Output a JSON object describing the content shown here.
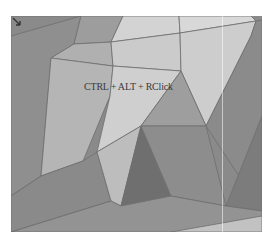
{
  "viewport": {
    "hint_text": "CTRL + ALT + RClick",
    "cursor_icon": "arrow-cursor-icon",
    "colors": {
      "edge": "#6e6e6e",
      "darkest": "#6f6f6f",
      "dark": "#858585",
      "mid": "#9c9c9c",
      "light": "#b8b8b8",
      "lighter": "#cacaca",
      "lightest": "#d8d8d8"
    }
  }
}
